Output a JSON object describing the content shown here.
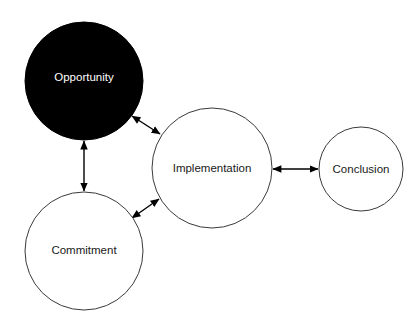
{
  "diagram": {
    "background_color": "#ffffff",
    "width": 420,
    "height": 330,
    "nodes": [
      {
        "id": "opportunity",
        "label": "Opportunity",
        "cx": 84,
        "cy": 81,
        "r": 59,
        "fill": "#000000",
        "stroke": "#000000",
        "text_color": "#ffffff",
        "style": "filled"
      },
      {
        "id": "commitment",
        "label": "Commitment",
        "cx": 84,
        "cy": 251,
        "r": 59,
        "fill": "#ffffff",
        "stroke": "#3a3a3a",
        "text_color": "#1a1a1a",
        "style": "outline"
      },
      {
        "id": "implementation",
        "label": "Implementation",
        "cx": 212,
        "cy": 168,
        "r": 60,
        "fill": "#ffffff",
        "stroke": "#3a3a3a",
        "text_color": "#1a1a1a",
        "style": "outline"
      },
      {
        "id": "conclusion",
        "label": "Conclusion",
        "cx": 361,
        "cy": 169,
        "r": 42,
        "fill": "#ffffff",
        "stroke": "#3a3a3a",
        "text_color": "#1a1a1a",
        "style": "outline"
      }
    ],
    "edges": [
      {
        "id": "opportunity-implementation",
        "from": "opportunity",
        "to": "implementation",
        "type": "double-arrow",
        "x1": 132,
        "y1": 116,
        "x2": 160,
        "y2": 134
      },
      {
        "id": "opportunity-commitment",
        "from": "opportunity",
        "to": "commitment",
        "type": "double-arrow",
        "x1": 84,
        "y1": 141,
        "x2": 84,
        "y2": 191
      },
      {
        "id": "commitment-implementation",
        "from": "commitment",
        "to": "implementation",
        "type": "double-arrow",
        "x1": 132,
        "y1": 218,
        "x2": 159,
        "y2": 199
      },
      {
        "id": "implementation-conclusion",
        "from": "implementation",
        "to": "conclusion",
        "type": "double-arrow",
        "x1": 273,
        "y1": 169,
        "x2": 318,
        "y2": 169
      }
    ]
  }
}
